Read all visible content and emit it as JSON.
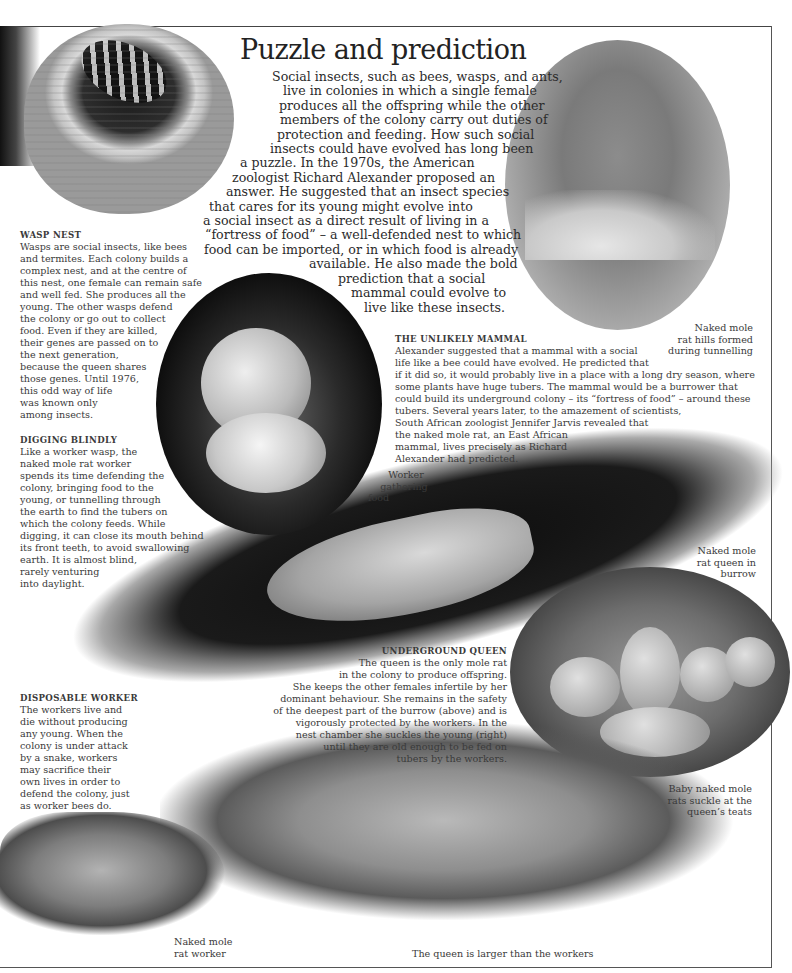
{
  "page": {
    "title": "Puzzle and prediction",
    "intro_lines": [
      "Social insects, such as bees, wasps, and ants,",
      "live in colonies in which a single female",
      "produces all the offspring while the other",
      "members of the colony carry out duties of",
      "protection and feeding. How such social",
      "insects could have evolved has long been",
      "a puzzle. In the 1970s, the American",
      "zoologist Richard Alexander proposed an",
      "answer. He suggested that an insect species",
      "that cares for its young might evolve into",
      "a social insect as a direct result of living in a",
      "“fortress of food” – a well-defended nest to which",
      "food can be imported, or in which food is already",
      "available. He also made the bold",
      "prediction that a social",
      "mammal could evolve to",
      "live like these insects."
    ]
  },
  "sections": {
    "wasp_nest": {
      "heading": "WASP NEST",
      "lines": [
        "Wasps are social insects, like bees",
        "and termites. Each colony builds a",
        "complex nest, and at the centre of",
        "this nest, one female can remain safe",
        "and well fed. She produces all the",
        "young. The other wasps defend",
        "the colony or go out to collect",
        "food. Even if they are killed,",
        "their genes are passed on to",
        "the next generation,",
        "because the queen shares",
        "those genes. Until 1976,",
        "this odd way of life",
        "was known only",
        "among insects."
      ]
    },
    "digging_blindly": {
      "heading": "DIGGING BLINDLY",
      "lines": [
        "Like a worker wasp, the",
        "naked mole rat worker",
        "spends its time defending the",
        "colony, bringing food to the",
        "young, or tunnelling through",
        "the earth to find the tubers on",
        "which the colony feeds. While",
        "digging, it can close its mouth behind",
        "its front teeth, to avoid swallowing",
        "earth. It is almost blind,",
        "rarely venturing",
        "into daylight."
      ]
    },
    "unlikely_mammal": {
      "heading": "THE UNLIKELY MAMMAL",
      "lines": [
        "Alexander suggested that a mammal with a social",
        "life like a bee could have evolved. He predicted that",
        "if it did so, it would probably live in a place with a long dry season, where",
        "some plants have huge tubers. The mammal would be a burrower that",
        "could build its underground colony – its “fortress of food” – around these",
        "tubers. Several years later, to the amazement of scientists,",
        "South African zoologist Jennifer Jarvis revealed that",
        "the naked mole rat, an East African",
        "mammal, lives precisely as Richard",
        "Alexander had predicted."
      ]
    },
    "underground_queen": {
      "heading": "UNDERGROUND QUEEN",
      "lines": [
        "The queen is the only mole rat",
        "in the colony to produce offspring.",
        "She keeps the other females infertile by her",
        "dominant behaviour. She remains in the safety",
        "of the deepest part of the burrow (above) and is",
        "vigorously protected by the workers. In the",
        "nest chamber she suckles the young (right)",
        "until they are old enough to be fed on",
        "tubers by the workers."
      ]
    },
    "disposable_worker": {
      "heading": "DISPOSABLE WORKER",
      "lines": [
        "The workers live and",
        "die without producing",
        "any young. When the",
        "colony is under attack",
        "by a snake, workers",
        "may sacrifice their",
        "own lives in order to",
        "defend the colony, just",
        "as worker bees do."
      ]
    }
  },
  "labels": {
    "hills": [
      "Naked mole",
      "rat hills formed",
      "during tunnelling"
    ],
    "worker_gathering": [
      "Worker",
      "gathering",
      "food"
    ],
    "queen_burrow": [
      "Naked mole",
      "rat queen in",
      "burrow"
    ],
    "baby": [
      "Baby naked mole",
      "rats suckle at the",
      "queen’s teats"
    ],
    "worker": [
      "Naked mole",
      "rat worker"
    ],
    "queen_larger": "The queen is larger than the workers"
  },
  "images": {
    "wasp_nest": "wasp-nest-photo",
    "hills": "mole-rat-hills-photo",
    "worker_food": "worker-gathering-food-photo",
    "burrow": "queen-in-burrow-photo",
    "nest": "baby-mole-rats-suckling-photo",
    "queen": "naked-mole-rat-queen-photo",
    "worker": "naked-mole-rat-worker-photo"
  }
}
